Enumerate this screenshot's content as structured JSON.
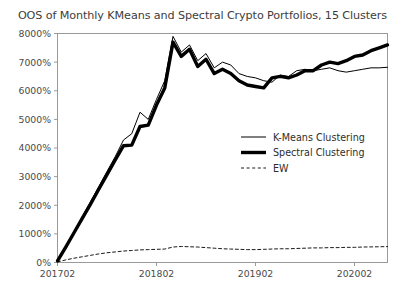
{
  "chart_data": {
    "type": "line",
    "title": "OOS of Monthly KMeans and Spectral Crypto Portfolios, 15 Clusters",
    "xlabel": "",
    "ylabel": "",
    "grid": false,
    "legend_position": "center-right",
    "xlim": [
      0,
      40
    ],
    "ylim": [
      0,
      8000
    ],
    "ytick_labels": [
      "0%",
      "1000%",
      "2000%",
      "3000%",
      "4000%",
      "5000%",
      "6000%",
      "7000%",
      "8000%"
    ],
    "ytick_values": [
      0,
      1000,
      2000,
      3000,
      4000,
      5000,
      6000,
      7000,
      8000
    ],
    "xtick_labels": [
      "201702",
      "201802",
      "201902",
      "202002"
    ],
    "xtick_values": [
      0,
      12,
      24,
      36
    ],
    "x": [
      0,
      1,
      2,
      3,
      4,
      5,
      6,
      7,
      8,
      9,
      10,
      11,
      12,
      13,
      14,
      15,
      16,
      17,
      18,
      19,
      20,
      21,
      22,
      23,
      24,
      25,
      26,
      27,
      28,
      29,
      30,
      31,
      32,
      33,
      34,
      35,
      36,
      37,
      38,
      39,
      40
    ],
    "series": [
      {
        "name": "K-Means Clustering",
        "style": "solid-thin",
        "values": [
          60,
          560,
          1080,
          1600,
          2120,
          2650,
          3180,
          3700,
          4280,
          4500,
          5250,
          5000,
          5700,
          6350,
          7900,
          7350,
          7600,
          7050,
          7300,
          6800,
          7000,
          6900,
          6600,
          6500,
          6450,
          6350,
          6300,
          6550,
          6500,
          6700,
          6750,
          6700,
          6750,
          6800,
          6700,
          6650,
          6700,
          6750,
          6800,
          6800,
          6820
        ]
      },
      {
        "name": "Spectral Clustering",
        "style": "solid-thick",
        "values": [
          60,
          540,
          1040,
          1540,
          2040,
          2560,
          3070,
          3580,
          4080,
          4100,
          4750,
          4800,
          5500,
          6100,
          7700,
          7200,
          7450,
          6850,
          7100,
          6600,
          6750,
          6600,
          6350,
          6200,
          6150,
          6100,
          6450,
          6500,
          6450,
          6550,
          6700,
          6700,
          6900,
          7000,
          6950,
          7050,
          7200,
          7250,
          7400,
          7500,
          7600
        ]
      },
      {
        "name": "EW",
        "style": "dashed",
        "values": [
          20,
          90,
          150,
          200,
          250,
          300,
          340,
          370,
          400,
          420,
          440,
          450,
          460,
          470,
          540,
          560,
          550,
          540,
          520,
          500,
          480,
          470,
          460,
          450,
          450,
          460,
          470,
          480,
          480,
          490,
          500,
          510,
          510,
          520,
          520,
          530,
          530,
          540,
          545,
          550,
          555
        ]
      }
    ]
  },
  "legend": {
    "entries": [
      {
        "label": "K-Means Clustering",
        "style": "solid-thin"
      },
      {
        "label": "Spectral Clustering",
        "style": "solid-thick"
      },
      {
        "label": "EW",
        "style": "dashed"
      }
    ]
  },
  "colors": {
    "line": "#000000",
    "axis": "#9a9a9a",
    "text": "#3d3d3d",
    "background": "#ffffff"
  }
}
